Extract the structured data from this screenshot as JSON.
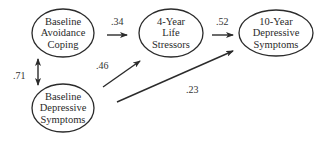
{
  "diagram": {
    "type": "path-model",
    "nodes": [
      {
        "id": "avoidance",
        "lines": [
          "Baseline",
          "Avoidance",
          "Coping"
        ],
        "cx": 63,
        "cy": 33,
        "rx": 31,
        "ry": 24
      },
      {
        "id": "stressors",
        "lines": [
          "4-Year",
          "Life",
          "Stressors"
        ],
        "cx": 171,
        "cy": 33,
        "rx": 32,
        "ry": 24
      },
      {
        "id": "outcome",
        "lines": [
          "10-Year",
          "Depressive",
          "Symptoms"
        ],
        "cx": 276,
        "cy": 33,
        "rx": 37,
        "ry": 23
      },
      {
        "id": "baseline_dep",
        "lines": [
          "Baseline",
          "Depressive",
          "Symptoms"
        ],
        "cx": 63,
        "cy": 108,
        "rx": 31,
        "ry": 24
      }
    ],
    "edges": [
      {
        "id": "avoidance_to_stressors",
        "from": "avoidance",
        "to": "stressors",
        "coefficient": ".34",
        "x1": 107,
        "y1": 35,
        "x2": 127,
        "y2": 35,
        "label_x": 111,
        "label_y": 17,
        "bidirectional": false
      },
      {
        "id": "stressors_to_outcome",
        "from": "stressors",
        "to": "outcome",
        "coefficient": ".52",
        "x1": 212,
        "y1": 35,
        "x2": 233,
        "y2": 35,
        "label_x": 216,
        "label_y": 17,
        "bidirectional": false
      },
      {
        "id": "baseline_dep_to_stressors",
        "from": "baseline_dep",
        "to": "stressors",
        "coefficient": ".46",
        "x1": 103,
        "y1": 87,
        "x2": 140,
        "y2": 61,
        "label_x": 96,
        "label_y": 61,
        "bidirectional": false
      },
      {
        "id": "baseline_dep_to_outcome",
        "from": "baseline_dep",
        "to": "outcome",
        "coefficient": ".23",
        "x1": 117,
        "y1": 102,
        "x2": 233,
        "y2": 51,
        "label_x": 186,
        "label_y": 85,
        "bidirectional": false
      },
      {
        "id": "avoidance_with_baseline_dep",
        "from": "avoidance",
        "to": "baseline_dep",
        "coefficient": ".71",
        "x1": 38,
        "y1": 59,
        "x2": 38,
        "y2": 85,
        "label_x": 13,
        "label_y": 71,
        "bidirectional": true
      }
    ],
    "colors": {
      "stroke": "#2b2b2b",
      "text": "#2a2a2a",
      "background": "#ffffff"
    }
  }
}
